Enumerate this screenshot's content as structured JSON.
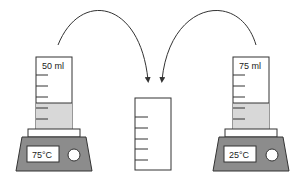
{
  "diagram": {
    "colors": {
      "stroke": "#333333",
      "liquid": "#d8d8d8",
      "hotplate_body": "#8c8c8c",
      "hotplate_top": "#ffffff",
      "display_bg": "#ffffff"
    },
    "left_setup": {
      "cylinder_label": "50 ml",
      "hotplate_temperature": "75°C"
    },
    "right_setup": {
      "cylinder_label": "75 ml",
      "hotplate_temperature": "25°C"
    },
    "center_container": {
      "label": ""
    },
    "arrows": [
      {
        "from": "left_cylinder",
        "to": "center_container"
      },
      {
        "from": "right_cylinder",
        "to": "center_container"
      }
    ]
  }
}
